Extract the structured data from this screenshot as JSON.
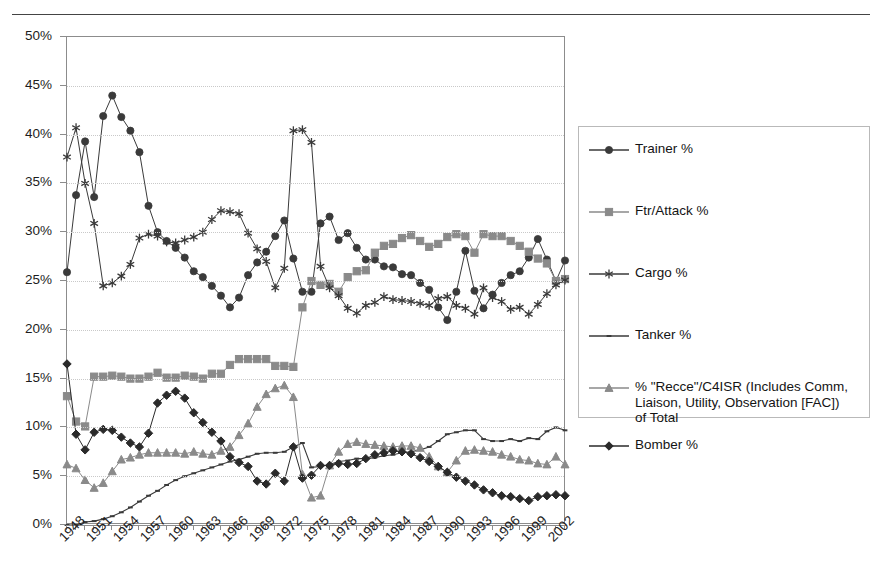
{
  "page": {
    "top_rule_fragment": ""
  },
  "chart_data": {
    "type": "line",
    "title": "",
    "xlabel": "",
    "ylabel": "",
    "ylim": [
      0,
      0.5
    ],
    "ytick_labels": [
      "0%",
      "5%",
      "10%",
      "15%",
      "20%",
      "25%",
      "30%",
      "35%",
      "40%",
      "45%",
      "50%"
    ],
    "ytick_values": [
      0,
      5,
      10,
      15,
      20,
      25,
      30,
      35,
      40,
      45,
      50
    ],
    "grid": true,
    "legend_position": "right",
    "x": [
      1948,
      1949,
      1950,
      1951,
      1952,
      1953,
      1954,
      1955,
      1956,
      1957,
      1958,
      1959,
      1960,
      1961,
      1962,
      1963,
      1964,
      1965,
      1966,
      1967,
      1968,
      1969,
      1970,
      1971,
      1972,
      1973,
      1974,
      1975,
      1976,
      1977,
      1978,
      1979,
      1980,
      1981,
      1982,
      1983,
      1984,
      1985,
      1986,
      1987,
      1988,
      1989,
      1990,
      1991,
      1992,
      1993,
      1994,
      1995,
      1996,
      1997,
      1998,
      1999,
      2000,
      2001,
      2002,
      2003
    ],
    "xtick_labels": [
      "1948",
      "1951",
      "1954",
      "1957",
      "1960",
      "1963",
      "1966",
      "1969",
      "1972",
      "1975",
      "1978",
      "1981",
      "1984",
      "1987",
      "1990",
      "1993",
      "1996",
      "1999",
      "2002"
    ],
    "series": [
      {
        "name": "Trainer %",
        "marker": "circle",
        "color": "#3a3a3a",
        "values": [
          25.9,
          33.8,
          39.3,
          33.6,
          41.9,
          44.0,
          41.8,
          40.4,
          38.2,
          32.7,
          30.0,
          29.1,
          28.4,
          27.4,
          26.0,
          25.4,
          24.5,
          23.5,
          22.3,
          23.3,
          25.6,
          26.9,
          28.0,
          29.6,
          31.2,
          27.3,
          23.9,
          23.9,
          30.9,
          31.6,
          29.2,
          29.9,
          28.4,
          27.2,
          27.2,
          26.5,
          26.4,
          25.7,
          25.6,
          24.8,
          24.1,
          22.3,
          21.0,
          23.9,
          28.1,
          24.0,
          22.2,
          23.6,
          24.8,
          25.6,
          26.0,
          27.4,
          29.3,
          27.2,
          25.0,
          27.1
        ]
      },
      {
        "name": "Ftr/Attack %",
        "marker": "square",
        "color": "#8a8a8a",
        "values": [
          13.2,
          10.6,
          10.1,
          15.2,
          15.2,
          15.3,
          15.2,
          15.0,
          15.0,
          15.2,
          15.6,
          15.1,
          15.1,
          15.3,
          15.2,
          15.0,
          15.5,
          15.5,
          16.4,
          17.0,
          17.0,
          17.0,
          17.0,
          16.3,
          16.3,
          16.2,
          22.3,
          25.0,
          24.6,
          24.7,
          23.9,
          25.4,
          26.0,
          26.1,
          27.9,
          28.6,
          28.8,
          29.4,
          29.7,
          29.1,
          28.5,
          28.8,
          29.5,
          29.8,
          29.6,
          27.9,
          29.8,
          29.6,
          29.6,
          29.1,
          28.6,
          28.0,
          27.3,
          26.8,
          25.0,
          25.2
        ]
      },
      {
        "name": "Cargo %",
        "marker": "asterisk",
        "color": "#3a3a3a",
        "values": [
          37.7,
          40.7,
          35.0,
          30.9,
          24.5,
          24.8,
          25.5,
          26.7,
          29.4,
          29.8,
          29.6,
          29.0,
          28.9,
          29.2,
          29.5,
          30.0,
          31.3,
          32.2,
          32.1,
          31.9,
          29.9,
          28.3,
          27.0,
          24.3,
          26.3,
          40.4,
          40.5,
          39.2,
          26.5,
          24.3,
          23.5,
          22.2,
          21.7,
          22.5,
          22.8,
          23.4,
          23.1,
          23.0,
          22.9,
          22.7,
          22.5,
          23.2,
          23.4,
          22.5,
          22.2,
          21.6,
          24.3,
          23.3,
          22.9,
          22.1,
          22.3,
          21.6,
          22.6,
          23.7,
          24.6,
          25.1
        ]
      },
      {
        "name": "Tanker %",
        "marker": "dash",
        "color": "#3a3a3a",
        "values": [
          0.0,
          0.0,
          0.3,
          0.4,
          0.6,
          0.9,
          1.3,
          1.8,
          2.4,
          3.0,
          3.5,
          4.1,
          4.6,
          5.0,
          5.3,
          5.6,
          5.9,
          6.2,
          6.5,
          6.7,
          7.0,
          7.3,
          7.4,
          7.4,
          7.5,
          8.0,
          8.4,
          5.9,
          6.0,
          6.2,
          6.5,
          6.6,
          6.8,
          6.8,
          6.9,
          7.1,
          7.2,
          7.4,
          7.5,
          7.7,
          8.0,
          8.6,
          9.3,
          9.5,
          9.7,
          9.7,
          8.8,
          8.6,
          8.6,
          8.8,
          8.6,
          8.9,
          8.8,
          9.6,
          10.0,
          9.7
        ]
      },
      {
        "name": "% \"Recce\"/C4ISR (Includes Comm,\nLiaison, Utility, Observation [FAC])\nof Total",
        "marker": "triangle",
        "color": "#8a8a8a",
        "values": [
          6.2,
          5.8,
          4.6,
          3.8,
          4.3,
          5.5,
          6.7,
          6.9,
          7.2,
          7.4,
          7.4,
          7.4,
          7.4,
          7.3,
          7.5,
          7.3,
          7.2,
          7.6,
          8.0,
          9.2,
          10.4,
          12.1,
          13.4,
          14.0,
          14.3,
          13.1,
          5.2,
          2.8,
          3.0,
          6.1,
          7.5,
          8.3,
          8.5,
          8.3,
          8.2,
          8.1,
          8.0,
          8.1,
          8.1,
          7.9,
          7.0,
          6.0,
          5.4,
          6.6,
          7.6,
          7.7,
          7.6,
          7.5,
          7.2,
          7.0,
          6.7,
          6.6,
          6.3,
          6.2,
          7.0,
          6.2
        ]
      },
      {
        "name": "Bomber %",
        "marker": "diamond",
        "color": "#2a2a2a",
        "values": [
          16.5,
          9.3,
          7.7,
          9.5,
          9.8,
          9.7,
          9.0,
          8.4,
          8.0,
          9.4,
          12.5,
          13.3,
          13.7,
          13.0,
          11.5,
          10.5,
          9.5,
          8.6,
          7.0,
          6.4,
          6.0,
          4.5,
          4.2,
          5.3,
          4.5,
          8.0,
          4.8,
          5.1,
          6.1,
          6.1,
          6.3,
          6.2,
          6.3,
          6.8,
          7.2,
          7.4,
          7.6,
          7.5,
          7.3,
          6.9,
          6.5,
          6.0,
          5.4,
          4.9,
          4.5,
          4.1,
          3.6,
          3.3,
          3.0,
          2.9,
          2.7,
          2.5,
          2.9,
          3.0,
          3.1,
          3.0
        ]
      }
    ]
  }
}
